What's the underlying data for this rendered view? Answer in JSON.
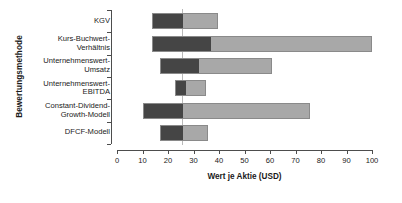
{
  "chart_data": {
    "type": "bar",
    "subtype": "horizontal-range-football-field",
    "title": "",
    "xlabel": "Wert je Aktie (USD)",
    "ylabel": "Bewertungsmethode",
    "xlim": [
      0,
      100
    ],
    "ylim": null,
    "grid": false,
    "legend": null,
    "xticks": [
      0,
      10,
      20,
      30,
      40,
      50,
      60,
      70,
      80,
      90,
      100
    ],
    "xticklabels": [
      "0",
      "10",
      "20",
      "30",
      "40",
      "50",
      "60",
      "70",
      "80",
      "90",
      "100"
    ],
    "reference_line": {
      "value": 25.5,
      "color": "#b9b9b9",
      "orientation": "vertical"
    },
    "categories": [
      "KGV",
      "Kurs-Buchwert-\nVerhältnis",
      "Unternehmenswert-\nUmsatz",
      "Unternehmenswert-\nEBITDA",
      "Constant-Dividend-\nGrowth-Modell",
      "DFCF-Modell"
    ],
    "series": [
      {
        "name": "low-range",
        "color": "#454545",
        "segments": [
          {
            "category": "KGV",
            "start": 13.7,
            "end": 25.5
          },
          {
            "category": "Kurs-Buchwert-Verhältnis",
            "start": 13.7,
            "end": 36.5
          },
          {
            "category": "Unternehmenswert-Umsatz",
            "start": 17.0,
            "end": 31.8
          },
          {
            "category": "Unternehmenswert-EBITDA",
            "start": 22.7,
            "end": 26.7
          },
          {
            "category": "Constant-Dividend-Growth-Modell",
            "start": 10.0,
            "end": 25.5
          },
          {
            "category": "DFCF-Modell",
            "start": 17.0,
            "end": 25.5
          }
        ]
      },
      {
        "name": "high-range",
        "color": "#a8a8a8",
        "segments": [
          {
            "category": "KGV",
            "start": 25.5,
            "end": 39.6
          },
          {
            "category": "Kurs-Buchwert-Verhältnis",
            "start": 36.5,
            "end": 100.0
          },
          {
            "category": "Unternehmenswert-Umsatz",
            "start": 31.8,
            "end": 60.8
          },
          {
            "category": "Unternehmenswert-EBITDA",
            "start": 26.7,
            "end": 34.9
          },
          {
            "category": "Constant-Dividend-Growth-Modell",
            "start": 25.5,
            "end": 75.7
          },
          {
            "category": "DFCF-Modell",
            "start": 25.5,
            "end": 35.7
          }
        ]
      }
    ],
    "bars": [
      {
        "category": "KGV",
        "low_start": 13.7,
        "split": 25.5,
        "high_end": 39.6
      },
      {
        "category": "Kurs-Buchwert-Verhältnis",
        "low_start": 13.7,
        "split": 36.5,
        "high_end": 100.0
      },
      {
        "category": "Unternehmenswert-Umsatz",
        "low_start": 17.0,
        "split": 31.8,
        "high_end": 60.8
      },
      {
        "category": "Unternehmenswert-EBITDA",
        "low_start": 22.7,
        "split": 26.7,
        "high_end": 34.9
      },
      {
        "category": "Constant-Dividend-Growth-Modell",
        "low_start": 10.0,
        "split": 25.5,
        "high_end": 75.7
      },
      {
        "category": "DFCF-Modell",
        "low_start": 17.0,
        "split": 25.5,
        "high_end": 35.7
      }
    ]
  }
}
